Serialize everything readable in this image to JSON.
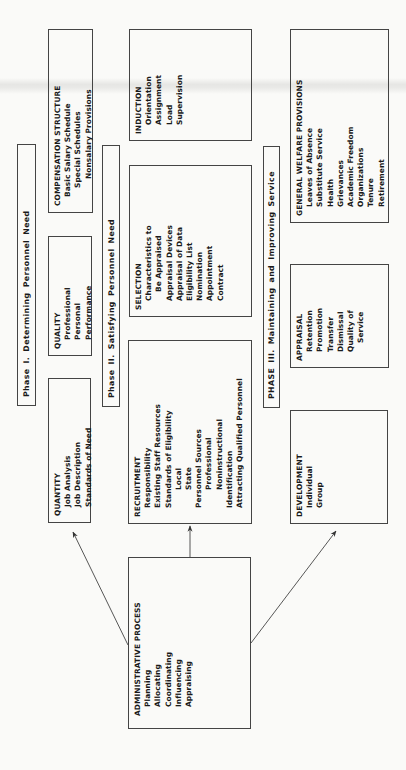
{
  "phases": [
    {
      "label": "Phase I.   Determining Personnel Need"
    },
    {
      "label": "Phase II.  Satisfying Personnel Need"
    },
    {
      "label": "PHASE III.  Maintaining and Improving Service"
    }
  ],
  "boxes": {
    "compensation": {
      "title": "COMPENSATION  STRUCTURE",
      "items": [
        "Basic Salary Schedule",
        "Special Schedules",
        "Nonsalary Provisions"
      ]
    },
    "quality": {
      "title": "QUALITY",
      "items": [
        "Professional",
        "Personal",
        "Performance"
      ]
    },
    "quantity": {
      "title": "QUANTITY",
      "items": [
        "Job Analysis",
        "Job Description",
        "Standards of Need"
      ]
    },
    "induction": {
      "title": "INDUCTION",
      "items": [
        "Orientation",
        "Assignment",
        "Load",
        "Supervision"
      ]
    },
    "selection": {
      "title": "SELECTION",
      "items": [
        "Characteristics to",
        "Be Appraised",
        "Appraisal Devices",
        "Appraisal of Data",
        "Eligibility List",
        "Nomination",
        "Appointment",
        "Contract"
      ]
    },
    "recruitment": {
      "title": "RECRUITMENT",
      "items": [
        "Responsibility",
        "Existing Staff Resources",
        "Standards of Eligibility",
        "Local",
        "State",
        "Personnel Sources",
        "Professional",
        "Noninstructional",
        "Identification",
        "Attracting Qualified Personnel"
      ]
    },
    "general_welfare": {
      "title": "GENERAL  WELFARE  PROVISIONS",
      "items": [
        "Leaves of Absence",
        "Substitute Service",
        "Health",
        "Grievances",
        "Academic Freedom",
        "Organizations",
        "Tenure",
        "Retirement"
      ]
    },
    "appraisal": {
      "title": "APPRAISAL",
      "items": [
        "Retention",
        "Promotion",
        "Transfer",
        "Dismissal",
        "Quality of",
        "Service"
      ]
    },
    "development": {
      "title": "DEVELOPMENT",
      "items": [
        "Individual",
        "Group"
      ]
    },
    "administrative": {
      "title": "ADMINISTRATIVE  PROCESS",
      "items": [
        "Planning",
        "Allocating",
        "Coordinating",
        "Influencing",
        "Appraising"
      ]
    }
  },
  "colors": {
    "line": "#444444",
    "text": "#1a1a1a",
    "background": "#fafaf8"
  }
}
